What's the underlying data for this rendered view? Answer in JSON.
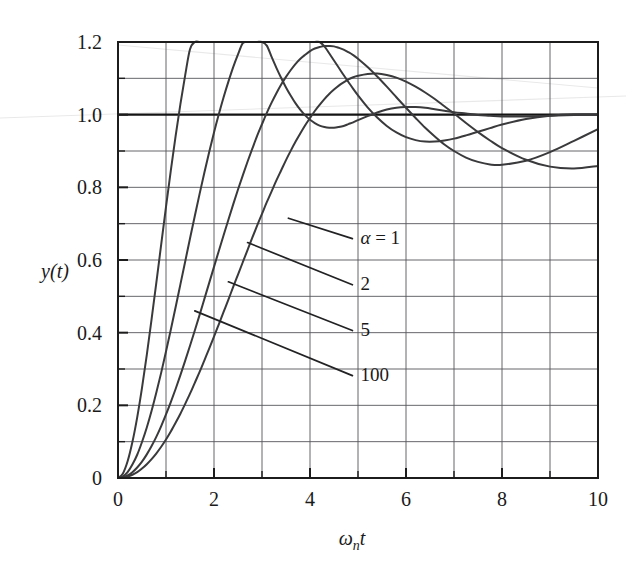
{
  "figure": {
    "kind": "line-plot",
    "background_color": "#ffffff",
    "ink_color": "#3a3a3c",
    "frame_color": "#1c1c1c",
    "grid_color": "#55565a"
  },
  "chart_data": {
    "type": "line",
    "title": "",
    "subtitle": "",
    "xlabel": "ωₙt",
    "xlabel_parts": {
      "omega": "ω",
      "subscript": "n",
      "variable": "t"
    },
    "ylabel": "y(t)",
    "xlim": [
      0,
      10
    ],
    "ylim": [
      0,
      1.2
    ],
    "xticks": [
      0,
      2,
      4,
      6,
      8,
      10
    ],
    "xtick_labels": [
      "0",
      "2",
      "4",
      "6",
      "8",
      "10"
    ],
    "yticks": [
      0,
      0.2,
      0.4,
      0.6,
      0.8,
      1.0,
      1.2
    ],
    "ytick_labels": [
      "0",
      "0.2",
      "0.4",
      "0.6",
      "0.8",
      "1.0",
      "1.2"
    ],
    "x_minor_step": 1,
    "y_minor_step": 0.1,
    "grid": true,
    "grid_minor": true,
    "legend_position": "inline-leader-labels",
    "reference_lines": [
      {
        "name": "unity-reference",
        "axis": "y",
        "value": 1.0,
        "emphasis": "heavy"
      }
    ],
    "annotations": [
      {
        "name": "alpha-equals-1",
        "text": "α = 1",
        "label_x": 5.05,
        "label_y": 0.645,
        "anchor_x": 3.55,
        "anchor_y": 0.715
      },
      {
        "name": "alpha-2",
        "text": "2",
        "label_x": 5.05,
        "label_y": 0.518,
        "anchor_x": 2.7,
        "anchor_y": 0.648
      },
      {
        "name": "alpha-5",
        "text": "5",
        "label_x": 5.05,
        "label_y": 0.392,
        "anchor_x": 2.3,
        "anchor_y": 0.54
      },
      {
        "name": "alpha-100",
        "text": "100",
        "label_x": 5.05,
        "label_y": 0.268,
        "anchor_x": 1.6,
        "anchor_y": 0.46
      }
    ],
    "x": [
      0,
      0.1,
      0.2,
      0.3,
      0.4,
      0.5,
      0.6,
      0.7,
      0.8,
      0.9,
      1.0,
      1.1,
      1.2,
      1.3,
      1.4,
      1.5,
      1.6,
      1.7,
      1.8,
      1.9,
      2.0,
      2.1,
      2.2,
      2.3,
      2.4,
      2.5,
      2.6,
      2.7,
      2.8,
      2.9,
      3.0,
      3.1,
      3.2,
      3.3,
      3.4,
      3.5,
      3.6,
      3.7,
      3.8,
      3.9,
      4.0,
      4.1,
      4.2,
      4.3,
      4.4,
      4.5,
      4.6,
      4.7,
      4.8,
      4.9,
      5.0,
      5.2,
      5.4,
      5.6,
      5.8,
      6.0,
      6.2,
      6.4,
      6.6,
      6.8,
      7.0,
      7.25,
      7.5,
      7.75,
      8.0,
      8.5,
      9.0,
      9.5,
      10.0
    ],
    "series": [
      {
        "name": "alpha-100",
        "label": "100",
        "alpha": 100,
        "peak_value": 1.155,
        "peak_time": 3.8,
        "values": [
          0,
          0.012,
          0.046,
          0.099,
          0.167,
          0.248,
          0.339,
          0.437,
          0.539,
          0.643,
          0.746,
          0.846,
          0.941,
          1.029,
          1.109,
          1.18,
          1.241,
          1.292,
          1.332,
          1.362,
          1.382,
          1.393,
          1.395,
          1.39,
          1.378,
          1.36,
          1.338,
          1.312,
          1.283,
          1.253,
          1.221,
          1.19,
          1.159,
          1.129,
          1.101,
          1.075,
          1.052,
          1.031,
          1.013,
          0.998,
          0.986,
          0.977,
          0.97,
          0.966,
          0.964,
          0.964,
          0.966,
          0.969,
          0.974,
          0.979,
          0.985,
          0.996,
          1.006,
          1.014,
          1.019,
          1.021,
          1.021,
          1.019,
          1.015,
          1.011,
          1.007,
          1.003,
          0.999,
          0.997,
          0.995,
          0.995,
          0.997,
          0.999,
          1.0
        ]
      },
      {
        "name": "alpha-5",
        "label": "5",
        "alpha": 5,
        "peak_value": 1.142,
        "peak_time": 4.3,
        "values": [
          0,
          0.004,
          0.016,
          0.037,
          0.064,
          0.099,
          0.139,
          0.185,
          0.236,
          0.29,
          0.348,
          0.408,
          0.47,
          0.533,
          0.596,
          0.659,
          0.721,
          0.782,
          0.841,
          0.897,
          0.951,
          1.001,
          1.048,
          1.091,
          1.131,
          1.166,
          1.197,
          1.224,
          1.247,
          1.265,
          1.28,
          1.291,
          1.297,
          1.301,
          1.301,
          1.297,
          1.291,
          1.282,
          1.271,
          1.257,
          1.242,
          1.225,
          1.207,
          1.188,
          1.169,
          1.149,
          1.129,
          1.109,
          1.09,
          1.071,
          1.053,
          1.02,
          0.992,
          0.969,
          0.951,
          0.938,
          0.93,
          0.926,
          0.926,
          0.929,
          0.934,
          0.943,
          0.953,
          0.963,
          0.973,
          0.988,
          0.997,
          1.001,
          1.001
        ]
      },
      {
        "name": "alpha-2",
        "label": "2",
        "alpha": 2,
        "peak_value": 1.082,
        "peak_time": 4.8,
        "values": [
          0,
          0.002,
          0.007,
          0.016,
          0.029,
          0.045,
          0.065,
          0.088,
          0.114,
          0.143,
          0.175,
          0.209,
          0.245,
          0.283,
          0.323,
          0.364,
          0.406,
          0.449,
          0.493,
          0.537,
          0.581,
          0.625,
          0.668,
          0.711,
          0.753,
          0.794,
          0.833,
          0.871,
          0.907,
          0.942,
          0.974,
          1.005,
          1.033,
          1.059,
          1.083,
          1.104,
          1.123,
          1.14,
          1.154,
          1.165,
          1.175,
          1.182,
          1.186,
          1.189,
          1.189,
          1.188,
          1.184,
          1.179,
          1.172,
          1.164,
          1.154,
          1.131,
          1.105,
          1.077,
          1.048,
          1.019,
          0.991,
          0.964,
          0.94,
          0.918,
          0.9,
          0.882,
          0.87,
          0.863,
          0.862,
          0.873,
          0.897,
          0.928,
          0.96
        ]
      },
      {
        "name": "alpha-1",
        "label": "α = 1",
        "alpha": 1,
        "peak_value": 0.993,
        "peak_time": 7.2,
        "values": [
          0,
          0.001,
          0.004,
          0.009,
          0.016,
          0.026,
          0.038,
          0.052,
          0.068,
          0.086,
          0.106,
          0.128,
          0.152,
          0.177,
          0.204,
          0.232,
          0.262,
          0.292,
          0.324,
          0.356,
          0.389,
          0.423,
          0.457,
          0.491,
          0.526,
          0.56,
          0.594,
          0.628,
          0.662,
          0.695,
          0.727,
          0.759,
          0.789,
          0.819,
          0.847,
          0.875,
          0.901,
          0.926,
          0.949,
          0.971,
          0.991,
          1.01,
          1.027,
          1.043,
          1.057,
          1.069,
          1.08,
          1.089,
          1.097,
          1.103,
          1.107,
          1.112,
          1.113,
          1.109,
          1.102,
          1.091,
          1.077,
          1.061,
          1.043,
          1.023,
          1.003,
          0.977,
          0.952,
          0.929,
          0.908,
          0.876,
          0.857,
          0.852,
          0.859
        ]
      }
    ]
  }
}
